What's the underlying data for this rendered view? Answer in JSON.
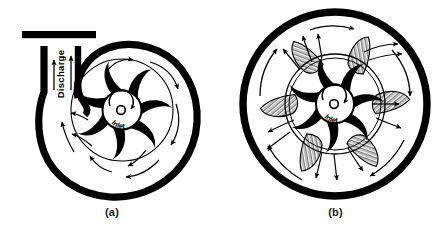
{
  "figure": {
    "type": "technical-diagram",
    "panels": [
      {
        "key": "a",
        "caption": "(a)",
        "casing_type": "volute",
        "labels": {
          "discharge": "Discharge",
          "inlet": "Inlet"
        },
        "impeller_blade_count": 7,
        "rotation": "clockwise",
        "has_discharge_nozzle": true,
        "has_discharge_flange": true,
        "has_diffuser_vanes": false,
        "flow_arrow_count": 9,
        "discharge_arrow_count": 2
      },
      {
        "key": "b",
        "caption": "(b)",
        "casing_type": "circular-with-diffuser",
        "labels": {
          "inlet": "Inlet"
        },
        "impeller_blade_count": 7,
        "rotation": "clockwise",
        "has_discharge_nozzle": false,
        "has_discharge_flange": false,
        "has_diffuser_vanes": true,
        "diffuser_vane_count": 6,
        "flow_arrow_count": 16
      }
    ]
  },
  "colors": {
    "ink": "#000000",
    "background": "#ffffff",
    "caption_text": "#1a1a1a",
    "hatch": "#000000"
  }
}
